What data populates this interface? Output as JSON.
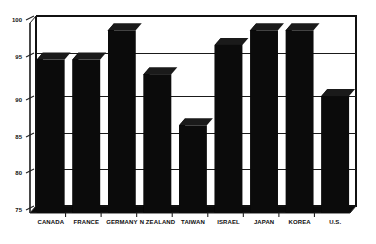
{
  "chart_data": {
    "type": "bar",
    "title": "",
    "xlabel": "",
    "ylabel": "",
    "categories": [
      "CANADA",
      "FRANCE",
      "GERMANY",
      "N ZEALAND",
      "TAIWAN",
      "ISRAEL",
      "JAPAN",
      "KOREA",
      "U.S."
    ],
    "values": [
      96,
      96,
      100,
      94,
      87,
      98,
      100,
      100,
      91
    ],
    "ylim": [
      75,
      101
    ],
    "yticks": [
      75,
      80,
      85,
      90,
      95,
      100
    ],
    "ytick_labels": [
      "75",
      "80",
      "85",
      "90",
      "95",
      "100"
    ],
    "gridlines": [
      80,
      85,
      90,
      96
    ],
    "grid": true,
    "legend": "none",
    "bar_color": "#0b0b0b",
    "background_color": "#ffffff",
    "style": "3d-perspective"
  },
  "axis": {
    "tick_labels": [
      "100",
      "95",
      "90",
      "85",
      "80",
      "75"
    ]
  },
  "bars": [
    {
      "label": "CANADA",
      "value": 96
    },
    {
      "label": "FRANCE",
      "value": 96
    },
    {
      "label": "GERMANY",
      "value": 100
    },
    {
      "label": "N ZEALAND",
      "value": 94
    },
    {
      "label": "TAIWAN",
      "value": 87
    },
    {
      "label": "ISRAEL",
      "value": 98
    },
    {
      "label": "JAPAN",
      "value": 100
    },
    {
      "label": "KOREA",
      "value": 100
    },
    {
      "label": "U.S.",
      "value": 91
    }
  ]
}
